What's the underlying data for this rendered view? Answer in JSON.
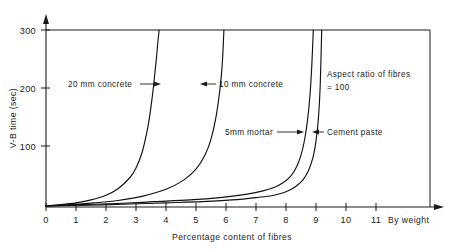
{
  "chart_data": {
    "type": "line",
    "title": "",
    "xlabel": "Percentage content of fibres",
    "ylabel": "V-B time (sec)",
    "xlim": [
      0,
      12.8
    ],
    "ylim": [
      0,
      300
    ],
    "grid": false,
    "legend_position": "inline-annotations",
    "x_ticks": [
      "0",
      "1",
      "2",
      "3",
      "4",
      "5",
      "6",
      "7",
      "8",
      "9",
      "10",
      "11"
    ],
    "x_tick_values": [
      0,
      1,
      2,
      3,
      4,
      5,
      6,
      7,
      8,
      9,
      10,
      11
    ],
    "x_axis_suffix": "By weight",
    "y_ticks": [
      "100",
      "200",
      "300"
    ],
    "y_tick_values": [
      100,
      200,
      300
    ],
    "annotation_note_line1": "Aspect ratio of fibres",
    "annotation_note_line2": "= 100",
    "series": [
      {
        "name": "20 mm concrete",
        "label": "20 mm concrete",
        "asymptote_x": 3.85,
        "points_x": [
          0.0,
          0.5,
          1.0,
          1.5,
          2.0,
          2.4,
          2.8,
          3.0,
          3.2,
          3.35,
          3.45,
          3.55,
          3.62,
          3.68,
          3.73,
          3.77
        ],
        "points_y": [
          2,
          4,
          7,
          12,
          20,
          31,
          50,
          66,
          92,
          124,
          152,
          190,
          222,
          252,
          280,
          300
        ]
      },
      {
        "name": "10 mm concrete",
        "label": "10 mm concrete",
        "asymptote_x": 5.95,
        "points_x": [
          0.0,
          0.8,
          1.6,
          2.4,
          3.2,
          4.0,
          4.6,
          5.0,
          5.3,
          5.5,
          5.65,
          5.78,
          5.86,
          5.9,
          5.93
        ],
        "points_y": [
          2,
          4,
          7,
          11,
          18,
          30,
          46,
          64,
          88,
          115,
          148,
          192,
          232,
          265,
          300
        ]
      },
      {
        "name": "5mm mortar",
        "label": "5mm mortar",
        "asymptote_x": 9.15,
        "points_x": [
          0.0,
          1.2,
          2.4,
          3.6,
          4.8,
          5.8,
          6.6,
          7.2,
          7.6,
          7.9,
          8.15,
          8.35,
          8.5,
          8.62,
          8.72,
          8.8,
          8.86,
          8.91
        ],
        "points_y": [
          2,
          4,
          6,
          9,
          12,
          16,
          21,
          27,
          33,
          41,
          52,
          68,
          88,
          114,
          148,
          190,
          240,
          300
        ]
      },
      {
        "name": "Cement paste",
        "label": "Cement paste",
        "asymptote_x": 9.35,
        "points_x": [
          0.0,
          1.4,
          2.8,
          4.0,
          5.2,
          6.2,
          7.0,
          7.6,
          8.0,
          8.3,
          8.55,
          8.75,
          8.9,
          9.0,
          9.08,
          9.14,
          9.19
        ],
        "points_y": [
          2,
          3,
          5,
          7,
          9,
          12,
          16,
          20,
          26,
          34,
          45,
          62,
          84,
          112,
          150,
          205,
          300
        ]
      }
    ],
    "annotations": [
      {
        "name": "20 mm concrete",
        "text": "20 mm concrete",
        "arrow": "right"
      },
      {
        "name": "10 mm concrete",
        "text": "10 mm concrete",
        "arrow": "left"
      },
      {
        "name": "5mm mortar",
        "text": "5mm mortar",
        "arrow": "right"
      },
      {
        "name": "Cement paste",
        "text": "Cement paste",
        "arrow": "left"
      }
    ]
  },
  "colors": {
    "ink": "#1a1a1a",
    "background": "#ffffff"
  }
}
